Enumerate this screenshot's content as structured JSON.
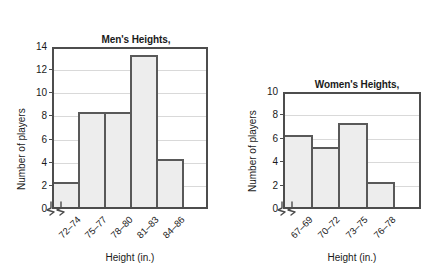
{
  "page": {
    "background": "#ffffff",
    "bar_fill": "#ededed",
    "bar_stroke": "#595959",
    "axis_color": "#4d4d4d",
    "grid_color": "#d9d9d9",
    "text_color": "#1a1a1a"
  },
  "chart_data": [
    {
      "type": "bar",
      "id": "mens-heights",
      "title": "Men's Heights,\nNational Basketball Team",
      "title_line1": "Men's Heights,",
      "title_line2": "National Basketball Team",
      "xlabel": "Height (in.)",
      "ylabel": "Number of players",
      "categories": [
        "72–74",
        "75–77",
        "78–80",
        "81–83",
        "84–86"
      ],
      "values": [
        2,
        8,
        8,
        13,
        4
      ],
      "yticks": [
        0,
        2,
        4,
        6,
        8,
        10,
        12,
        14
      ],
      "ylim": [
        0,
        14
      ],
      "grid": true,
      "axis_break": true,
      "legend": "none"
    },
    {
      "type": "bar",
      "id": "womens-heights",
      "title": "Women's Heights,\nNational  Basketball Team",
      "title_line1": "Women's Heights,",
      "title_line2": "National  Basketball Team",
      "xlabel": "Height (in.)",
      "ylabel": "Number of players",
      "categories": [
        "67–69",
        "70–72",
        "73–75",
        "76–78"
      ],
      "values": [
        6,
        5,
        7,
        2
      ],
      "yticks": [
        0,
        2,
        4,
        6,
        8,
        10
      ],
      "ylim": [
        0,
        10
      ],
      "grid": true,
      "axis_break": true,
      "legend": "none"
    }
  ]
}
